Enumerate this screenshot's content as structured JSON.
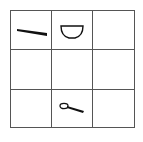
{
  "grid": {
    "rows": 3,
    "cols": 3,
    "cells": [
      {
        "row": 0,
        "col": 0,
        "item": "chopsticks-icon"
      },
      {
        "row": 0,
        "col": 1,
        "item": "bowl-icon"
      },
      {
        "row": 0,
        "col": 2,
        "item": null
      },
      {
        "row": 1,
        "col": 0,
        "item": null
      },
      {
        "row": 1,
        "col": 1,
        "item": null
      },
      {
        "row": 1,
        "col": 2,
        "item": null
      },
      {
        "row": 2,
        "col": 0,
        "item": null
      },
      {
        "row": 2,
        "col": 1,
        "item": "spoon-icon"
      },
      {
        "row": 2,
        "col": 2,
        "item": null
      }
    ],
    "line_color": "#555555"
  }
}
